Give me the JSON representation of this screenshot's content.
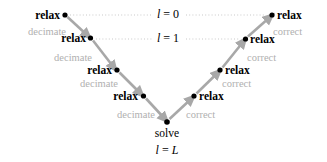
{
  "figure": {
    "width": 327,
    "height": 162,
    "background": "#ffffff",
    "arrow_color": "#a8a8a8",
    "dot_color": "#000000",
    "dotted_line_color": "#c8c8c8",
    "op_label_color": "#b0b0b0",
    "text_color": "#000000"
  },
  "left_branch": {
    "operation_label": "decimate",
    "node_label": "relax",
    "nodes": [
      {
        "label": "relax",
        "x": 65,
        "y": 15,
        "level": 0
      },
      {
        "label": "relax",
        "x": 90.5,
        "y": 38,
        "level": 1
      },
      {
        "label": "relax",
        "x": 117,
        "y": 70,
        "level": 2
      },
      {
        "label": "relax",
        "x": 143.5,
        "y": 96,
        "level": 3
      }
    ],
    "operations": [
      {
        "label": "decimate",
        "x": 51,
        "y": 31
      },
      {
        "label": "decimate",
        "x": 77,
        "y": 57
      },
      {
        "label": "decimate",
        "x": 103,
        "y": 83
      },
      {
        "label": "decimate",
        "x": 139,
        "y": 114
      }
    ]
  },
  "right_branch": {
    "operation_label": "correct",
    "node_label": "relax",
    "nodes": [
      {
        "label": "relax",
        "x": 272,
        "y": 15,
        "level": 0
      },
      {
        "label": "relax",
        "x": 245.5,
        "y": 39,
        "level": 1
      },
      {
        "label": "relax",
        "x": 220,
        "y": 70,
        "level": 2
      },
      {
        "label": "relax",
        "x": 194,
        "y": 96,
        "level": 3
      }
    ],
    "operations": [
      {
        "label": "correct",
        "x": 277,
        "y": 31
      },
      {
        "label": "correct",
        "x": 250,
        "y": 57
      },
      {
        "label": "correct",
        "x": 226,
        "y": 83
      },
      {
        "label": "correct",
        "x": 196,
        "y": 114
      }
    ]
  },
  "bottom": {
    "node": {
      "label": "solve",
      "x": 167,
      "y": 122
    },
    "solve_label": "solve",
    "level_label": {
      "var": "l",
      "eq": "=",
      "value": "L",
      "full": "l = L"
    }
  },
  "levels": [
    {
      "var": "l",
      "eq": "=",
      "value": "0",
      "full": "l = 0",
      "y": 15,
      "x": 168,
      "left_x": 70,
      "right_x": 267
    },
    {
      "var": "l",
      "eq": "=",
      "value": "1",
      "full": "l = 1",
      "y": 39,
      "x": 168,
      "left_x": 96,
      "right_x": 241
    }
  ],
  "geometry": {
    "apex": {
      "x": 167,
      "y": 122
    },
    "left_top": {
      "x": 65,
      "y": 15
    },
    "right_top": {
      "x": 272,
      "y": 15
    }
  }
}
